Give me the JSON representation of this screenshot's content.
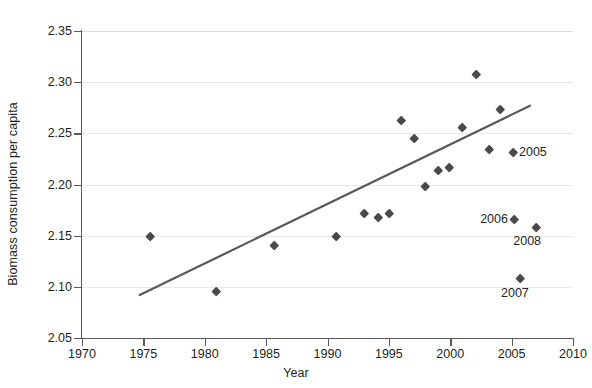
{
  "chart_data": {
    "type": "scatter",
    "title": "",
    "xlabel": "Year",
    "ylabel": "Biomass consumption per capita",
    "xlim": [
      1970,
      2010
    ],
    "ylim": [
      2.05,
      2.35
    ],
    "xticks": [
      1970,
      1975,
      1980,
      1985,
      1990,
      1995,
      2000,
      2005,
      2010
    ],
    "xtick_labels": [
      "1970",
      "1975",
      "1980",
      "1985",
      "1990",
      "1995",
      "2000",
      "2005",
      "2010"
    ],
    "yticks": [
      2.05,
      2.1,
      2.15,
      2.2,
      2.25,
      2.3,
      2.35
    ],
    "ytick_labels": [
      "2.05",
      "2.10",
      "2.15",
      "2.20",
      "2.25",
      "2.30",
      "2.35"
    ],
    "grid": "horizontal",
    "legend": "none",
    "marker": "diamond",
    "marker_color": "#4a4a4c",
    "points": [
      {
        "x": 1975.6,
        "y": 2.149
      },
      {
        "x": 1980.9,
        "y": 2.096
      },
      {
        "x": 1985.7,
        "y": 2.141
      },
      {
        "x": 1990.7,
        "y": 2.149
      },
      {
        "x": 1993.0,
        "y": 2.172
      },
      {
        "x": 1994.1,
        "y": 2.168
      },
      {
        "x": 1995.0,
        "y": 2.172
      },
      {
        "x": 1996.0,
        "y": 2.263
      },
      {
        "x": 1997.1,
        "y": 2.245
      },
      {
        "x": 1998.0,
        "y": 2.198
      },
      {
        "x": 1999.0,
        "y": 2.214
      },
      {
        "x": 1999.9,
        "y": 2.217
      },
      {
        "x": 2001.0,
        "y": 2.256
      },
      {
        "x": 2002.1,
        "y": 2.308
      },
      {
        "x": 2003.2,
        "y": 2.234
      },
      {
        "x": 2004.1,
        "y": 2.274
      },
      {
        "x": 2005.1,
        "y": 2.232,
        "label": "2005"
      },
      {
        "x": 2005.2,
        "y": 2.166,
        "label": "2006"
      },
      {
        "x": 2007.0,
        "y": 2.158,
        "label": "2008"
      },
      {
        "x": 2005.7,
        "y": 2.108,
        "label": "2007"
      }
    ],
    "trendline": {
      "x_start": 1974.7,
      "y_start": 2.092,
      "x_end": 2006.5,
      "y_end": 2.277,
      "color": "#58595b"
    },
    "annotations": [
      {
        "text": "2005",
        "x": 2005.6,
        "y": 2.232,
        "anchor": "start"
      },
      {
        "text": "2006",
        "x": 2004.7,
        "y": 2.166,
        "anchor": "end"
      },
      {
        "text": "2008",
        "x": 2007.4,
        "y": 2.145,
        "anchor": "end"
      },
      {
        "text": "2007",
        "x": 2006.4,
        "y": 2.094,
        "anchor": "end"
      }
    ]
  },
  "axes": {
    "y_title": "Biomass consumption per capita",
    "x_title": "Year"
  },
  "colors": {
    "axis": "#58595b",
    "grid": "#e9e9e9",
    "marker": "#4a4a4c",
    "trend": "#58595b",
    "text": "#231f20"
  }
}
